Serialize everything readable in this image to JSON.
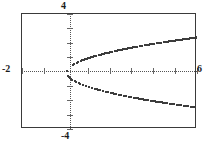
{
  "screen": {
    "kind": "graphing-calculator-plot",
    "background_color": "#ffffff",
    "border_color": "#3a3a3a",
    "axis_color": "#555555",
    "curve_color": "#3c3c3c"
  },
  "labels": {
    "top": "4",
    "bottom": "-4",
    "left": "-2",
    "right": "6"
  },
  "chart_data": {
    "type": "line",
    "title": "",
    "subtitle": "",
    "xlabel": "",
    "ylabel": "",
    "xlim": [
      -2,
      6
    ],
    "ylim": [
      -4,
      4
    ],
    "grid": false,
    "axes_style": "dotted-with-ticks",
    "legend": null,
    "legend_position": "none",
    "tick_labels": {
      "x": [
        "-2",
        "6"
      ],
      "y": [
        "-4",
        "4"
      ]
    },
    "x_tick_step": 1,
    "y_tick_step": 1,
    "equation": "x = y^2",
    "series": [
      {
        "name": "upper branch y = sqrt(x)",
        "x": [
          0,
          0.15,
          0.3,
          0.5,
          0.75,
          1,
          1.3,
          1.6,
          2,
          2.4,
          2.8,
          3.2,
          3.6,
          4,
          4.4,
          4.8,
          5.2,
          5.6,
          6
        ],
        "y": [
          0,
          0.387,
          0.548,
          0.707,
          0.866,
          1,
          1.14,
          1.265,
          1.414,
          1.549,
          1.673,
          1.789,
          1.897,
          2,
          2.098,
          2.191,
          2.28,
          2.366,
          2.449
        ]
      },
      {
        "name": "lower branch y = -sqrt(x)",
        "x": [
          0,
          0.15,
          0.3,
          0.5,
          0.75,
          1,
          1.3,
          1.6,
          2,
          2.4,
          2.8,
          3.2,
          3.6,
          4,
          4.4,
          4.8,
          5.2,
          5.6,
          6
        ],
        "y": [
          0,
          -0.387,
          -0.548,
          -0.707,
          -0.866,
          -1,
          -1.14,
          -1.265,
          -1.414,
          -1.549,
          -1.673,
          -1.789,
          -1.897,
          -2,
          -2.098,
          -2.191,
          -2.28,
          -2.366,
          -2.449
        ]
      }
    ]
  }
}
